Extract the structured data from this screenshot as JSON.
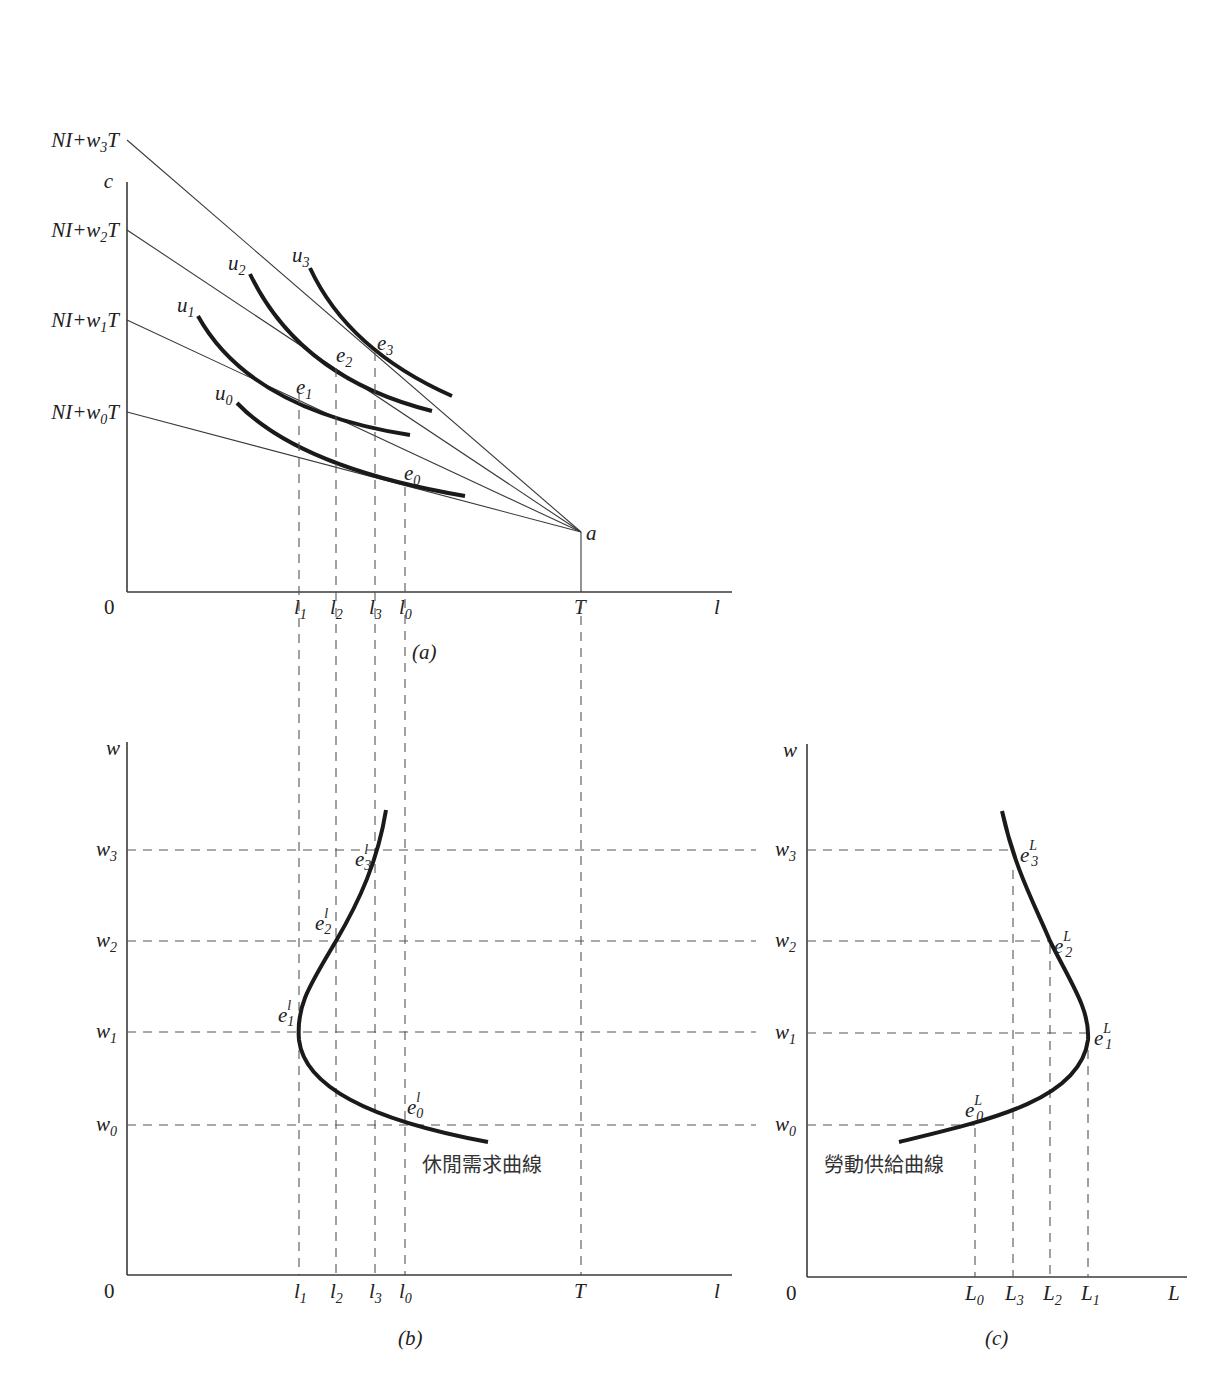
{
  "panels": {
    "a": {
      "caption": "(a)",
      "y_axis": "c",
      "x_axis": "l",
      "origin": "0",
      "budget_intercepts": [
        {
          "pre": "NI+w",
          "sub": "3",
          "post": "T"
        },
        {
          "pre": "NI+w",
          "sub": "2",
          "post": "T"
        },
        {
          "pre": "NI+w",
          "sub": "1",
          "post": "T"
        },
        {
          "pre": "NI+w",
          "sub": "0",
          "post": "T"
        }
      ],
      "kink_point": "a",
      "endowment": "T",
      "indifference_curves": [
        {
          "base": "u",
          "sub": "3"
        },
        {
          "base": "u",
          "sub": "2"
        },
        {
          "base": "u",
          "sub": "1"
        },
        {
          "base": "u",
          "sub": "0"
        }
      ],
      "equilibria": [
        {
          "base": "e",
          "sub": "3"
        },
        {
          "base": "e",
          "sub": "2"
        },
        {
          "base": "e",
          "sub": "1"
        },
        {
          "base": "e",
          "sub": "0"
        }
      ],
      "x_ticks": [
        {
          "base": "l",
          "sub": "1"
        },
        {
          "base": "l",
          "sub": "2"
        },
        {
          "base": "l",
          "sub": "3"
        },
        {
          "base": "l",
          "sub": "0"
        }
      ]
    },
    "b": {
      "caption": "(b)",
      "y_axis": "w",
      "x_axis": "l",
      "origin": "0",
      "y_ticks": [
        {
          "base": "w",
          "sub": "3"
        },
        {
          "base": "w",
          "sub": "2"
        },
        {
          "base": "w",
          "sub": "1"
        },
        {
          "base": "w",
          "sub": "0"
        }
      ],
      "x_ticks": [
        {
          "base": "l",
          "sub": "1"
        },
        {
          "base": "l",
          "sub": "2"
        },
        {
          "base": "l",
          "sub": "3"
        },
        {
          "base": "l",
          "sub": "0"
        }
      ],
      "endowment": "T",
      "points": [
        {
          "base": "e",
          "sup": "l",
          "sub": "3"
        },
        {
          "base": "e",
          "sup": "l",
          "sub": "2"
        },
        {
          "base": "e",
          "sup": "l",
          "sub": "1"
        },
        {
          "base": "e",
          "sup": "l",
          "sub": "0"
        }
      ],
      "curve_label": "休閒需求曲線"
    },
    "c": {
      "caption": "(c)",
      "y_axis": "w",
      "x_axis": "L",
      "origin": "0",
      "y_ticks": [
        {
          "base": "w",
          "sub": "3"
        },
        {
          "base": "w",
          "sub": "2"
        },
        {
          "base": "w",
          "sub": "1"
        },
        {
          "base": "w",
          "sub": "0"
        }
      ],
      "x_ticks": [
        {
          "base": "L",
          "sub": "0"
        },
        {
          "base": "L",
          "sub": "3"
        },
        {
          "base": "L",
          "sub": "2"
        },
        {
          "base": "L",
          "sub": "1"
        }
      ],
      "points": [
        {
          "base": "e",
          "sup": "L",
          "sub": "3"
        },
        {
          "base": "e",
          "sup": "L",
          "sub": "2"
        },
        {
          "base": "e",
          "sup": "L",
          "sub": "1"
        },
        {
          "base": "e",
          "sup": "L",
          "sub": "0"
        }
      ],
      "curve_label": "勞動供給曲線"
    }
  }
}
